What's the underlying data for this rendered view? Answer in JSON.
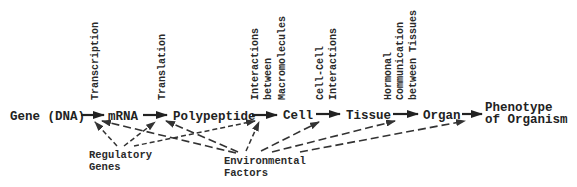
{
  "diagram": {
    "type": "flow",
    "nodes": [
      {
        "id": "gene",
        "label": "Gene (DNA)"
      },
      {
        "id": "mrna",
        "label": "mRNA"
      },
      {
        "id": "polypeptide",
        "label": "Polypeptide"
      },
      {
        "id": "cell",
        "label": "Cell"
      },
      {
        "id": "tissue",
        "label": "Tissue"
      },
      {
        "id": "organ",
        "label": "Organ"
      },
      {
        "id": "phenotype",
        "label_lines": [
          "Phenotype",
          "of Organism"
        ]
      }
    ],
    "process_labels": [
      {
        "between": "gene-mrna",
        "lines": [
          "Transcription"
        ]
      },
      {
        "between": "mrna-polypeptide",
        "lines": [
          "Translation"
        ]
      },
      {
        "between": "polypeptide-cell",
        "lines": [
          "Interactions",
          "between",
          "Macromolecules"
        ]
      },
      {
        "between": "cell-tissue",
        "lines": [
          "Cell-Cell",
          "Interactions"
        ]
      },
      {
        "between": "tissue-organ",
        "lines": [
          "Hormonal",
          "Communication",
          "between Tissues"
        ]
      }
    ],
    "influences": [
      {
        "id": "regulatory",
        "label_lines": [
          "Regulatory",
          "Genes"
        ],
        "targets": [
          "mrna",
          "polypeptide",
          "polypeptide-cell arrow"
        ]
      },
      {
        "id": "environmental",
        "label_lines": [
          "Environmental",
          "Factors"
        ],
        "targets": [
          "mrna",
          "polypeptide",
          "polypeptide-cell arrow",
          "cell-tissue arrow",
          "tissue-organ arrow",
          "organ-phenotype arrow"
        ]
      }
    ]
  }
}
